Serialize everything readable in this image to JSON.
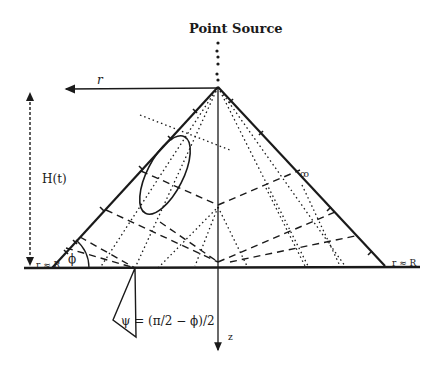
{
  "diagram": {
    "title": "Point Source",
    "labels": {
      "radius": "r",
      "height": "H(t)",
      "angle_phi": "ϕ",
      "psi_equation": "ψ = (π/2 − ϕ)/2",
      "depth_axis": "z",
      "left_base_tag": "r = R",
      "right_base_tag": "r = R"
    },
    "colors": {
      "ink": "#1a1a1a",
      "background": "#ffffff"
    },
    "geometry": {
      "apex": [
        218,
        87
      ],
      "left_base": [
        52,
        268
      ],
      "right_base": [
        385,
        266
      ],
      "baseline_y": 268
    }
  }
}
